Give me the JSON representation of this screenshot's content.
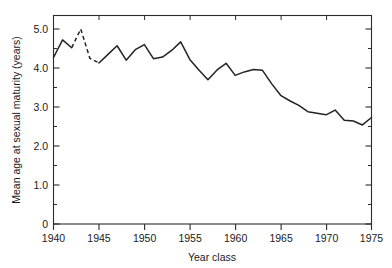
{
  "chart_data": {
    "type": "line",
    "title": "",
    "xlabel": "Year class",
    "ylabel": "Mean age at sexual maturity (years)",
    "xlim": [
      1940,
      1975
    ],
    "ylim": [
      0,
      5.3
    ],
    "grid": false,
    "legend": null,
    "x_ticks": [
      1940,
      1945,
      1950,
      1955,
      1960,
      1965,
      1970,
      1975
    ],
    "x_tick_labels": [
      "1940",
      "1945",
      "1950",
      "1955",
      "1960",
      "1965",
      "1970",
      "1975"
    ],
    "x_minor_tick_interval": 1,
    "y_ticks": [
      0,
      1.0,
      2.0,
      3.0,
      4.0,
      5.0
    ],
    "y_tick_labels": [
      "0",
      "1.0",
      "2.0",
      "3.0",
      "4.0",
      "5.0"
    ],
    "y_minor_tick_interval": 0.5,
    "series": [
      {
        "name": "Mean age at sexual maturity",
        "style": "solid-with-dashed-gap",
        "x": [
          1940,
          1941,
          1942,
          1943,
          1944,
          1945,
          1946,
          1947,
          1948,
          1949,
          1950,
          1951,
          1952,
          1953,
          1954,
          1955,
          1956,
          1957,
          1958,
          1959,
          1960,
          1961,
          1962,
          1963,
          1964,
          1965,
          1966,
          1967,
          1968,
          1969,
          1970,
          1971,
          1972,
          1973,
          1974,
          1975
        ],
        "values": [
          4.27,
          4.72,
          4.52,
          5.0,
          4.25,
          4.13,
          4.35,
          4.57,
          4.2,
          4.47,
          4.6,
          4.24,
          4.28,
          4.45,
          4.67,
          4.22,
          3.95,
          3.7,
          3.95,
          4.12,
          3.81,
          3.9,
          3.96,
          3.94,
          3.6,
          3.3,
          3.16,
          3.04,
          2.88,
          2.84,
          2.8,
          2.92,
          2.66,
          2.64,
          2.54,
          2.73
        ],
        "dashed_from": 1942,
        "dashed_to": 1945
      }
    ]
  },
  "axes": {
    "y_axis_label": "Mean age at sexual maturity (years)",
    "x_axis_label": "Year class"
  }
}
